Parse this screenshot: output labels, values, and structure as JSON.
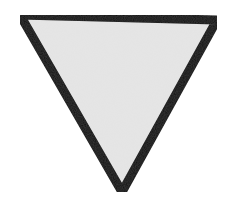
{
  "figure": {
    "shape": "inverted-triangle",
    "vertices": {
      "top_left": [
        20,
        15
      ],
      "top_right": [
        217,
        20
      ],
      "bottom": [
        122,
        192
      ]
    },
    "fill_color": "#e6e6e6",
    "stroke_color": "#111111",
    "stroke_width": 9
  }
}
